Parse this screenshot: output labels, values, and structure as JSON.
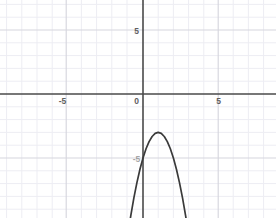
{
  "chart_data": {
    "type": "line",
    "title": "",
    "subtitle": "",
    "xlabel": "",
    "ylabel": "",
    "function": "y = -2(x - 1)^2 - 3",
    "curve_kind": "parabola",
    "opens": "down",
    "vertex": {
      "x": 1,
      "y": -3
    },
    "y_intercept": -5,
    "x_intercepts": [],
    "leading_coefficient": -2,
    "xlim": [
      -8.8,
      8.0
    ],
    "ylim": [
      -9.7,
      7.3
    ],
    "xticks": [
      -5,
      0,
      5
    ],
    "yticks": [
      5,
      -5
    ],
    "xtick_labels": [
      "-5",
      "0",
      "5"
    ],
    "ytick_labels": [
      "5",
      "-5"
    ],
    "origin_label": "0",
    "grid": true,
    "grid_minor_step": 1,
    "grid_major_step": 5,
    "legend": false,
    "legend_position": "none",
    "series": [
      {
        "name": "parabola",
        "x": [
          -1.6,
          -1.4,
          -1.2,
          -1.0,
          -0.8,
          -0.6,
          -0.4,
          -0.2,
          0.0,
          0.2,
          0.4,
          0.6,
          0.8,
          1.0,
          1.2,
          1.4,
          1.6,
          1.8,
          2.0,
          2.2,
          2.4,
          2.6,
          2.8,
          3.0,
          3.2,
          3.4,
          3.6
        ],
        "y": [
          -16.52,
          -14.52,
          -12.68,
          -11.0,
          -9.48,
          -8.12,
          -6.92,
          -5.88,
          -5.0,
          -4.28,
          -3.72,
          -3.32,
          -3.08,
          -3.0,
          -3.08,
          -3.32,
          -3.72,
          -4.28,
          -5.0,
          -5.88,
          -6.92,
          -8.12,
          -9.48,
          -11.0,
          -12.68,
          -14.52,
          -16.52
        ]
      }
    ],
    "colors": {
      "curve": "#3a3a3a",
      "axis": "#4a4a4a",
      "grid_minor": "#ededf3",
      "grid_major": "#d8d8e0",
      "tick_label": "#606060",
      "background": "#ffffff"
    }
  },
  "ticks": {
    "x_neg_five": "-5",
    "x_zero": "0",
    "x_pos_five": "5",
    "y_pos_five": "5",
    "y_neg_five": "-5"
  }
}
